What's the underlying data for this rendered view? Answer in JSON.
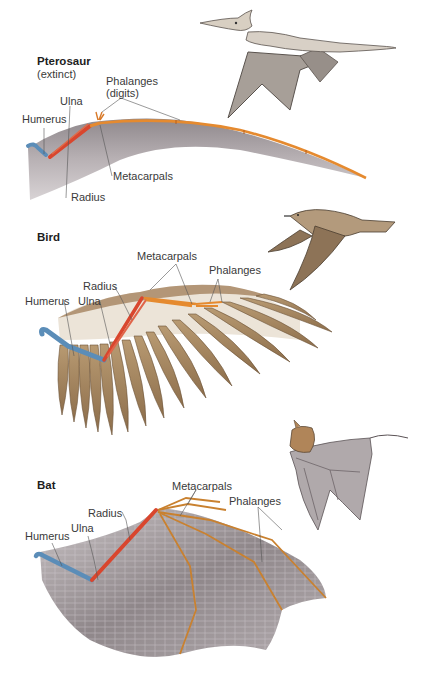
{
  "figure": {
    "colors": {
      "humerus": "#5b8db8",
      "radius_ulna": "#d9462e",
      "metacarpals_phalanges": "#e58a2f",
      "pterosaur_membrane": "#a9a2a6",
      "bird_feathers": "#a88a63",
      "bat_membrane": "#9e9699",
      "label_text": "#3a3a3a"
    },
    "panels": [
      {
        "id": "pterosaur",
        "title": "Pterosaur",
        "subtitle": "(extinct)",
        "labels": {
          "humerus": "Humerus",
          "ulna": "Ulna",
          "radius": "Radius",
          "metacarpals": "Metacarpals",
          "phalanges": "Phalanges",
          "phalanges_note": "(digits)"
        }
      },
      {
        "id": "bird",
        "title": "Bird",
        "labels": {
          "humerus": "Humerus",
          "ulna": "Ulna",
          "radius": "Radius",
          "metacarpals": "Metacarpals",
          "phalanges": "Phalanges"
        }
      },
      {
        "id": "bat",
        "title": "Bat",
        "labels": {
          "humerus": "Humerus",
          "ulna": "Ulna",
          "radius": "Radius",
          "metacarpals": "Metacarpals",
          "phalanges": "Phalanges"
        }
      }
    ]
  }
}
